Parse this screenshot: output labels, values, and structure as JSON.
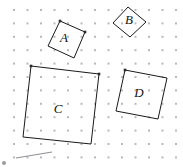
{
  "figure": {
    "width": 183,
    "height": 167,
    "background_color": "#ffffff",
    "grid": {
      "type": "dot-grid",
      "dot_color": "#b9b9bd",
      "dot_radius": 1,
      "spacing_x": 13.5,
      "spacing_y": 13.4,
      "origin_x": 14,
      "origin_y": 10,
      "columns": 13,
      "rows": 12
    },
    "stroke_color": "#1a1a1a",
    "stroke_width": 1,
    "label_color": "#111111",
    "shapes": [
      {
        "id": "shape-a",
        "label": "A",
        "label_x": 64,
        "label_y": 39,
        "points": "60,21 85,32 74,58 48,46",
        "corner_dots": [
          "60,21",
          "85,32"
        ]
      },
      {
        "id": "shape-b",
        "label": "B",
        "label_x": 129,
        "label_y": 21,
        "points": "128,7 146,22 130,37 113,23",
        "corner_dots": []
      },
      {
        "id": "shape-c",
        "label": "C",
        "label_x": 58,
        "label_y": 110,
        "points": "31,66 99,74 91,144 23,137",
        "corner_dots": [
          "31,66",
          "99,74"
        ]
      },
      {
        "id": "shape-d",
        "label": "D",
        "label_x": 139,
        "label_y": 94,
        "points": "125,70 167,78 158,119 116,111",
        "corner_dots": [
          "125,70"
        ]
      }
    ],
    "stray_marks": [
      {
        "id": "stray-line",
        "path": "M 16 158 L 52 152"
      },
      {
        "id": "stray-dot-1",
        "x": 4,
        "y": 163,
        "r": 2
      }
    ]
  }
}
